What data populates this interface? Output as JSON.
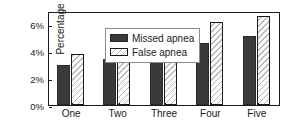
{
  "chart_data": {
    "type": "bar",
    "title": "",
    "subtitle": "",
    "xlabel": "",
    "ylabel": "Percentage",
    "categories": [
      "One",
      "Two",
      "Three",
      "Four",
      "Five"
    ],
    "series": [
      {
        "name": "Missed apnea",
        "values": [
          3.0,
          3.45,
          4.2,
          4.65,
          5.15
        ],
        "color": "#3a3a3a",
        "fill": "solid"
      },
      {
        "name": "False apnea",
        "values": [
          3.8,
          4.55,
          5.55,
          6.2,
          6.6
        ],
        "color": "#ffffff",
        "fill": "diagonal-hatch"
      }
    ],
    "ylim": [
      0,
      7
    ],
    "yticks": [
      0,
      2,
      4,
      6
    ],
    "ytick_labels": [
      "0%",
      "2%",
      "4%",
      "6%"
    ],
    "grid": false,
    "legend_position": "top-left",
    "axis_color": "#1a1a1a"
  },
  "legend": {
    "items": [
      {
        "label": "Missed apnea"
      },
      {
        "label": "False apnea"
      }
    ]
  }
}
